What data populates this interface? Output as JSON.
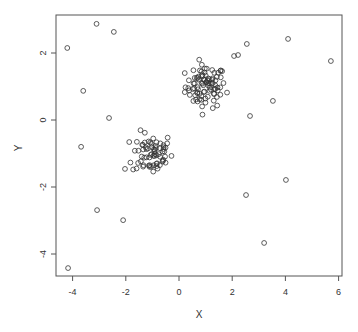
{
  "chart_data": {
    "type": "scatter",
    "title": "",
    "xlabel": "X",
    "ylabel": "Y",
    "xlim": [
      -4.4,
      6.0
    ],
    "ylim": [
      -4.7,
      3.15
    ],
    "xticks": [
      -4,
      -2,
      0,
      2,
      4,
      6
    ],
    "yticks": [
      -4,
      -2,
      0,
      2
    ],
    "xtick_labels": [
      "-4",
      "-2",
      "0",
      "2",
      "4",
      "6"
    ],
    "ytick_labels": [
      "-4",
      "-2",
      "0",
      "2"
    ],
    "grid": false,
    "legend": null,
    "marker": "open-circle",
    "marker_color": "#333333",
    "outliers": [
      {
        "x": -4.2,
        "y": 2.15
      },
      {
        "x": -3.1,
        "y": 2.87
      },
      {
        "x": -2.45,
        "y": 2.63
      },
      {
        "x": -3.6,
        "y": 0.87
      },
      {
        "x": -2.63,
        "y": 0.06
      },
      {
        "x": -3.68,
        "y": -0.8
      },
      {
        "x": -2.03,
        "y": -1.46
      },
      {
        "x": -3.08,
        "y": -2.69
      },
      {
        "x": -2.1,
        "y": -2.99
      },
      {
        "x": -4.17,
        "y": -4.42
      },
      {
        "x": 2.55,
        "y": 2.27
      },
      {
        "x": 4.1,
        "y": 2.42
      },
      {
        "x": 2.07,
        "y": 1.91
      },
      {
        "x": 2.22,
        "y": 1.94
      },
      {
        "x": 5.71,
        "y": 1.76
      },
      {
        "x": 3.53,
        "y": 0.57
      },
      {
        "x": 2.67,
        "y": 0.12
      },
      {
        "x": 4.02,
        "y": -1.79
      },
      {
        "x": 2.52,
        "y": -2.24
      },
      {
        "x": 3.2,
        "y": -3.67
      }
    ],
    "clusters": [
      {
        "name": "cluster-upper-right",
        "center": [
          1.0,
          1.0
        ],
        "sd_x": 0.38,
        "sd_y": 0.32,
        "n": 90
      },
      {
        "name": "cluster-lower-left",
        "center": [
          -1.0,
          -1.0
        ],
        "sd_x": 0.38,
        "sd_y": 0.32,
        "n": 70
      }
    ]
  },
  "axes": {
    "x_title": "X",
    "y_title": "Y"
  }
}
